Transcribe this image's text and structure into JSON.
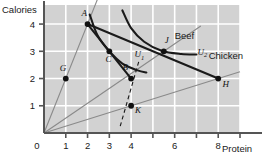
{
  "figure": {
    "background_color": "#ffffff",
    "plot_background_color": "#d2d2d2",
    "gridline_color": "#ffffff",
    "axis_color": "#555555",
    "budget_line_color": "#1a1a1a",
    "ray_color": "#8a8a8a",
    "indifference_curve_color": "#1a1a1a"
  },
  "axes": {
    "x": {
      "label": "Protein",
      "min": 0,
      "max": 9,
      "ticks": [
        0,
        1,
        2,
        3,
        4,
        5,
        6,
        7,
        8,
        9
      ],
      "tick_labels": [
        {
          "value": 0,
          "text": "0"
        },
        {
          "value": 1,
          "text": "1"
        },
        {
          "value": 2,
          "text": "2"
        },
        {
          "value": 3,
          "text": "3"
        },
        {
          "value": 4,
          "text": "4"
        },
        {
          "value": 6,
          "text": "6"
        },
        {
          "value": 8,
          "text": "8"
        }
      ]
    },
    "y": {
      "label": "Calories",
      "min": 0,
      "max": 4.7,
      "ticks": [
        1,
        2,
        3,
        4
      ],
      "tick_labels": [
        {
          "value": 1,
          "text": "1"
        },
        {
          "value": 2,
          "text": "2"
        },
        {
          "value": 3,
          "text": "3"
        },
        {
          "value": 4,
          "text": "4"
        }
      ]
    }
  },
  "chart_data": {
    "type": "line",
    "title": "",
    "xlabel": "Protein",
    "ylabel": "Calories",
    "xlim": [
      0,
      9
    ],
    "ylim": [
      0,
      4.7
    ],
    "grid": true,
    "legend": "inline-annotations",
    "rays": [
      {
        "name": "Pork",
        "label": "Pork",
        "from": [
          0,
          0
        ],
        "to": [
          2.75,
          5.5
        ],
        "slope": 2.0,
        "label_pos": [
          2.35,
          5.05
        ]
      },
      {
        "name": "Beef",
        "label": "Beef",
        "from": [
          0,
          0
        ],
        "to": [
          7.2,
          3.93
        ],
        "slope": 0.545,
        "label_pos": [
          6.45,
          3.45
        ]
      },
      {
        "name": "Chicken",
        "label": "Chicken",
        "from": [
          0,
          0
        ],
        "to": [
          9.0,
          2.25
        ],
        "slope": 0.25,
        "label_pos": [
          8.35,
          2.72
        ]
      }
    ],
    "points": [
      {
        "name": "A",
        "label": "A",
        "x": 2,
        "y": 4,
        "label_pos": [
          1.72,
          4.28
        ]
      },
      {
        "name": "G",
        "label": "G",
        "x": 1,
        "y": 2,
        "label_pos": [
          0.72,
          2.28
        ]
      },
      {
        "name": "C",
        "label": "C",
        "x": 3,
        "y": 3,
        "label_pos": [
          2.82,
          2.62
        ]
      },
      {
        "name": "B",
        "label": "B",
        "x": 4,
        "y": 2,
        "label_pos": [
          3.6,
          2.3
        ]
      },
      {
        "name": "J",
        "label": "J",
        "x": 5.5,
        "y": 3,
        "label_pos": [
          5.55,
          3.3
        ]
      },
      {
        "name": "H",
        "label": "H",
        "x": 8,
        "y": 2,
        "label_pos": [
          8.2,
          1.7
        ]
      },
      {
        "name": "K",
        "label": "K",
        "x": 4,
        "y": 1,
        "label_pos": [
          4.18,
          0.72
        ]
      }
    ],
    "budget_lines": [
      {
        "name": "budget-A-H",
        "from": [
          2,
          4
        ],
        "to": [
          8,
          2
        ]
      },
      {
        "name": "segment-A-C",
        "from": [
          2,
          4
        ],
        "to": [
          3,
          3
        ]
      },
      {
        "name": "segment-C-B",
        "from": [
          3,
          3
        ],
        "to": [
          4,
          2
        ]
      }
    ],
    "indifference_curves": [
      {
        "name": "U1",
        "label": "U",
        "subscript": "1",
        "label_pos": [
          4.15,
          2.78
        ],
        "path": [
          [
            2.1,
            4.35
          ],
          [
            2.45,
            3.6
          ],
          [
            3.0,
            3.0
          ],
          [
            3.6,
            2.55
          ],
          [
            4.3,
            2.3
          ],
          [
            4.7,
            2.22
          ]
        ]
      },
      {
        "name": "U2",
        "label": "U",
        "subscript": "2",
        "label_pos": [
          7.05,
          2.88
        ],
        "path": [
          [
            3.6,
            4.5
          ],
          [
            4.0,
            3.85
          ],
          [
            4.6,
            3.35
          ],
          [
            5.4,
            3.02
          ],
          [
            6.3,
            2.9
          ],
          [
            7.0,
            2.88
          ]
        ]
      }
    ],
    "dashed_lines": [
      {
        "name": "dashed-through-K",
        "from": [
          3.5,
          0.25
        ],
        "to": [
          4.35,
          2.62
        ]
      }
    ]
  }
}
